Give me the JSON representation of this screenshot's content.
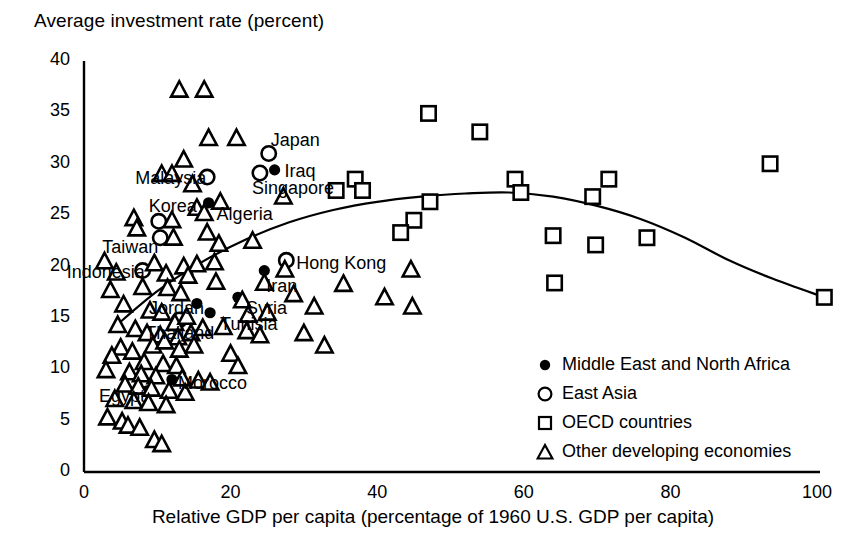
{
  "chart_data": {
    "type": "scatter",
    "title": "Average investment rate (percent)",
    "ylabel": "Average investment rate (percent)",
    "xlabel": "Relative GDP per capita (percentage of 1960 U.S. GDP per capita)",
    "xlim": [
      0,
      100
    ],
    "ylim": [
      0,
      40
    ],
    "xticks": [
      0,
      20,
      40,
      60,
      80,
      100
    ],
    "yticks": [
      0,
      5,
      10,
      15,
      20,
      25,
      30,
      35,
      40
    ],
    "grid": false,
    "legend_position": "bottom-right",
    "legend": [
      {
        "marker": "filled-circle",
        "label": "Middle East and North Africa"
      },
      {
        "marker": "open-circle",
        "label": "East Asia"
      },
      {
        "marker": "open-square",
        "label": "OECD countries"
      },
      {
        "marker": "open-triangle",
        "label": "Other developing economies"
      }
    ],
    "series": [
      {
        "name": "Middle East and North Africa",
        "marker": "filled-circle",
        "points": [
          {
            "x": 17.0,
            "y": 26.2,
            "label": "Algeria",
            "label_dx": 8,
            "label_dy": 12
          },
          {
            "x": 26.0,
            "y": 29.4,
            "label": "Iraq",
            "label_dx": 10,
            "label_dy": 2
          },
          {
            "x": 24.6,
            "y": 19.6,
            "label": "Iran",
            "label_dx": 2,
            "label_dy": 16
          },
          {
            "x": 21.0,
            "y": 17.0,
            "label": "Syria",
            "label_dx": 8,
            "label_dy": 12
          },
          {
            "x": 15.4,
            "y": 16.4,
            "label": "Jordan",
            "label_dx": -48,
            "label_dy": 6
          },
          {
            "x": 17.2,
            "y": 15.5,
            "label": "Tunisia",
            "label_dx": 10,
            "label_dy": 12
          },
          {
            "x": 12.0,
            "y": 9.0,
            "label": "Morocco",
            "label_dx": 6,
            "label_dy": 4
          },
          {
            "x": 8.6,
            "y": 7.9,
            "label": "Egypt",
            "label_dx": -48,
            "label_dy": 6
          }
        ]
      },
      {
        "name": "East Asia",
        "marker": "open-circle",
        "points": [
          {
            "x": 25.2,
            "y": 31.0,
            "label": "Japan",
            "label_dx": 2,
            "label_dy": -12
          },
          {
            "x": 24.0,
            "y": 29.1,
            "label": "Singapore",
            "label_dx": -8,
            "label_dy": 16
          },
          {
            "x": 16.8,
            "y": 28.7,
            "label": "Malaysia",
            "label_dx": -72,
            "label_dy": 2
          },
          {
            "x": 10.2,
            "y": 24.4,
            "label": "Korea",
            "label_dx": -10,
            "label_dy": -14
          },
          {
            "x": 10.4,
            "y": 22.8,
            "label": "Taiwan",
            "label_dx": -58,
            "label_dy": 10
          },
          {
            "x": 8.0,
            "y": 19.6,
            "label": "Indonesia",
            "label_dx": -76,
            "label_dy": 2
          },
          {
            "x": 27.6,
            "y": 20.6,
            "label": "Hong Kong",
            "label_dx": 10,
            "label_dy": 4
          },
          {
            "x": 13.0,
            "y": 14.8,
            "label": "Thailand",
            "label_dx": -34,
            "label_dy": 14
          }
        ]
      },
      {
        "name": "OECD countries",
        "marker": "open-square",
        "points": [
          {
            "x": 47.0,
            "y": 34.9
          },
          {
            "x": 54.0,
            "y": 33.1
          },
          {
            "x": 34.4,
            "y": 27.4
          },
          {
            "x": 37.0,
            "y": 28.5
          },
          {
            "x": 38.0,
            "y": 27.4
          },
          {
            "x": 47.2,
            "y": 26.3
          },
          {
            "x": 58.8,
            "y": 28.5
          },
          {
            "x": 59.6,
            "y": 27.2
          },
          {
            "x": 69.4,
            "y": 26.8
          },
          {
            "x": 71.6,
            "y": 28.5
          },
          {
            "x": 93.6,
            "y": 30.0
          },
          {
            "x": 45.0,
            "y": 24.5
          },
          {
            "x": 43.2,
            "y": 23.3
          },
          {
            "x": 64.0,
            "y": 23.0
          },
          {
            "x": 69.8,
            "y": 22.1
          },
          {
            "x": 76.8,
            "y": 22.8
          },
          {
            "x": 64.2,
            "y": 18.4
          },
          {
            "x": 101.0,
            "y": 17.0
          }
        ]
      },
      {
        "name": "Other developing economies",
        "marker": "open-triangle",
        "points": [
          {
            "x": 13.0,
            "y": 37.1
          },
          {
            "x": 16.4,
            "y": 37.1
          },
          {
            "x": 17.0,
            "y": 32.4
          },
          {
            "x": 20.8,
            "y": 32.4
          },
          {
            "x": 13.6,
            "y": 30.3
          },
          {
            "x": 10.6,
            "y": 28.9
          },
          {
            "x": 12.0,
            "y": 28.9
          },
          {
            "x": 14.8,
            "y": 27.9
          },
          {
            "x": 27.2,
            "y": 26.7
          },
          {
            "x": 18.6,
            "y": 26.2
          },
          {
            "x": 15.4,
            "y": 25.6
          },
          {
            "x": 16.4,
            "y": 25.1
          },
          {
            "x": 6.8,
            "y": 24.6
          },
          {
            "x": 7.2,
            "y": 23.6
          },
          {
            "x": 12.0,
            "y": 24.4
          },
          {
            "x": 12.2,
            "y": 22.7
          },
          {
            "x": 16.8,
            "y": 23.2
          },
          {
            "x": 18.4,
            "y": 22.1
          },
          {
            "x": 23.0,
            "y": 22.4
          },
          {
            "x": 9.6,
            "y": 20.2
          },
          {
            "x": 13.6,
            "y": 19.9
          },
          {
            "x": 15.4,
            "y": 20.1
          },
          {
            "x": 17.8,
            "y": 20.3
          },
          {
            "x": 11.2,
            "y": 19.2
          },
          {
            "x": 14.2,
            "y": 19.0
          },
          {
            "x": 4.4,
            "y": 19.3
          },
          {
            "x": 27.4,
            "y": 19.6
          },
          {
            "x": 24.6,
            "y": 18.3
          },
          {
            "x": 3.6,
            "y": 17.6
          },
          {
            "x": 8.0,
            "y": 17.9
          },
          {
            "x": 11.4,
            "y": 17.8
          },
          {
            "x": 13.2,
            "y": 17.3
          },
          {
            "x": 21.6,
            "y": 16.6
          },
          {
            "x": 22.4,
            "y": 15.2
          },
          {
            "x": 5.4,
            "y": 16.2
          },
          {
            "x": 9.0,
            "y": 15.6
          },
          {
            "x": 10.6,
            "y": 15.4
          },
          {
            "x": 12.4,
            "y": 14.4
          },
          {
            "x": 14.0,
            "y": 15.0
          },
          {
            "x": 4.6,
            "y": 14.2
          },
          {
            "x": 7.0,
            "y": 13.8
          },
          {
            "x": 8.6,
            "y": 13.4
          },
          {
            "x": 10.4,
            "y": 13.2
          },
          {
            "x": 12.8,
            "y": 13.0
          },
          {
            "x": 14.6,
            "y": 13.4
          },
          {
            "x": 16.2,
            "y": 13.9
          },
          {
            "x": 22.2,
            "y": 13.6
          },
          {
            "x": 5.0,
            "y": 12.0
          },
          {
            "x": 6.6,
            "y": 11.6
          },
          {
            "x": 9.4,
            "y": 12.2
          },
          {
            "x": 11.0,
            "y": 12.6
          },
          {
            "x": 13.0,
            "y": 11.8
          },
          {
            "x": 15.0,
            "y": 12.2
          },
          {
            "x": 3.8,
            "y": 11.2
          },
          {
            "x": 8.2,
            "y": 10.6
          },
          {
            "x": 10.8,
            "y": 10.4
          },
          {
            "x": 12.6,
            "y": 10.2
          },
          {
            "x": 6.2,
            "y": 9.6
          },
          {
            "x": 7.8,
            "y": 9.4
          },
          {
            "x": 9.8,
            "y": 9.2
          },
          {
            "x": 13.4,
            "y": 9.0
          },
          {
            "x": 15.6,
            "y": 8.8
          },
          {
            "x": 17.2,
            "y": 8.6
          },
          {
            "x": 5.6,
            "y": 8.4
          },
          {
            "x": 7.4,
            "y": 8.2
          },
          {
            "x": 9.2,
            "y": 8.0
          },
          {
            "x": 11.6,
            "y": 7.8
          },
          {
            "x": 13.8,
            "y": 7.6
          },
          {
            "x": 4.2,
            "y": 7.0
          },
          {
            "x": 6.8,
            "y": 6.8
          },
          {
            "x": 8.8,
            "y": 6.6
          },
          {
            "x": 11.2,
            "y": 6.4
          },
          {
            "x": 3.2,
            "y": 5.2
          },
          {
            "x": 5.2,
            "y": 4.8
          },
          {
            "x": 6.0,
            "y": 4.4
          },
          {
            "x": 7.6,
            "y": 4.2
          },
          {
            "x": 9.6,
            "y": 3.0
          },
          {
            "x": 10.6,
            "y": 2.6
          },
          {
            "x": 2.8,
            "y": 20.4
          },
          {
            "x": 3.0,
            "y": 9.8
          },
          {
            "x": 18.0,
            "y": 18.4
          },
          {
            "x": 19.0,
            "y": 14.0
          },
          {
            "x": 20.0,
            "y": 11.4
          },
          {
            "x": 21.0,
            "y": 10.2
          },
          {
            "x": 25.0,
            "y": 15.4
          },
          {
            "x": 24.0,
            "y": 13.2
          },
          {
            "x": 28.6,
            "y": 17.2
          },
          {
            "x": 31.4,
            "y": 16.0
          },
          {
            "x": 30.0,
            "y": 13.4
          },
          {
            "x": 32.8,
            "y": 12.2
          },
          {
            "x": 35.4,
            "y": 18.2
          },
          {
            "x": 41.0,
            "y": 16.9
          },
          {
            "x": 44.6,
            "y": 19.6
          },
          {
            "x": 44.8,
            "y": 16.0
          }
        ]
      }
    ],
    "trend_curve": {
      "description": "fitted quadratic trend line",
      "points": [
        {
          "x": 4.0,
          "y": 14.0
        },
        {
          "x": 10.0,
          "y": 17.6
        },
        {
          "x": 16.0,
          "y": 20.4
        },
        {
          "x": 22.0,
          "y": 22.6
        },
        {
          "x": 28.0,
          "y": 24.3
        },
        {
          "x": 34.0,
          "y": 25.5
        },
        {
          "x": 40.0,
          "y": 26.3
        },
        {
          "x": 46.0,
          "y": 26.8
        },
        {
          "x": 52.0,
          "y": 27.1
        },
        {
          "x": 58.0,
          "y": 27.2
        },
        {
          "x": 64.0,
          "y": 26.8
        },
        {
          "x": 70.0,
          "y": 25.9
        },
        {
          "x": 76.0,
          "y": 24.6
        },
        {
          "x": 82.0,
          "y": 22.8
        },
        {
          "x": 88.0,
          "y": 20.6
        },
        {
          "x": 94.0,
          "y": 18.8
        },
        {
          "x": 101.0,
          "y": 17.0
        }
      ]
    }
  }
}
